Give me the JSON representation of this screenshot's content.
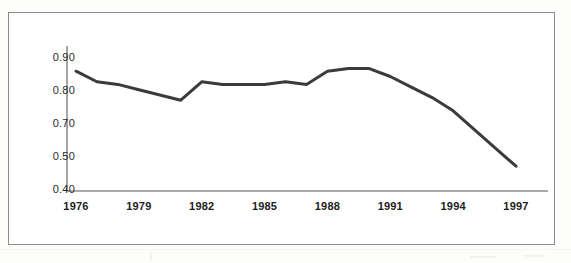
{
  "figure": {
    "frame_color": "#8d8d8d",
    "background": "#ffffff"
  },
  "chart_data": {
    "type": "line",
    "title": "",
    "subtitle": "",
    "xlabel": "",
    "ylabel": "",
    "grid": false,
    "legend": false,
    "legend_position": "none",
    "line_color": "#3b3b3b",
    "line_width": 3,
    "xlim": [
      1976,
      1997
    ],
    "ylim": [
      0.4,
      0.9
    ],
    "x_tick_labels": [
      "1976",
      "1979",
      "1982",
      "1985",
      "1988",
      "1991",
      "1994",
      "1997"
    ],
    "x_ticks": [
      1976,
      1979,
      1982,
      1985,
      1988,
      1991,
      1994,
      1997
    ],
    "y_tick_labels": [
      "0.90",
      "0.80",
      "0.70",
      "0.50",
      "0.40"
    ],
    "y_tick_positions": [
      0.9,
      0.8,
      0.7,
      0.6,
      0.5
    ],
    "y_tick_note": "Labels as printed in the source: 0.90, 0.80, 0.70, 0.50, 0.40 at evenly spaced positions.",
    "x": [
      1976,
      1977,
      1978,
      1979,
      1980,
      1981,
      1982,
      1983,
      1984,
      1985,
      1986,
      1987,
      1988,
      1989,
      1990,
      1991,
      1992,
      1993,
      1994,
      1995,
      1996,
      1997
    ],
    "values": [
      0.85,
      0.81,
      0.8,
      0.78,
      0.76,
      0.74,
      0.81,
      0.8,
      0.8,
      0.8,
      0.81,
      0.8,
      0.85,
      0.86,
      0.86,
      0.83,
      0.79,
      0.75,
      0.7,
      0.63,
      0.56,
      0.49
    ],
    "series": [
      {
        "name": "series-1",
        "values": [
          0.85,
          0.81,
          0.8,
          0.78,
          0.76,
          0.74,
          0.81,
          0.8,
          0.8,
          0.8,
          0.81,
          0.8,
          0.85,
          0.86,
          0.86,
          0.83,
          0.79,
          0.75,
          0.7,
          0.63,
          0.56,
          0.49
        ]
      }
    ]
  }
}
